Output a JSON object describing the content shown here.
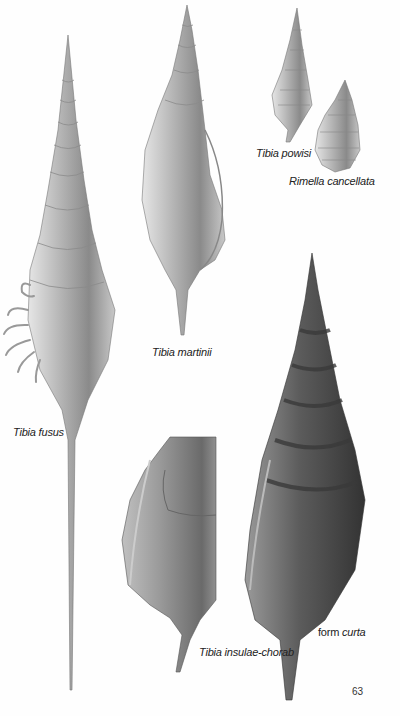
{
  "page": {
    "page_number": "63",
    "background": "#fefefe"
  },
  "specimens": [
    {
      "id": "tibia-fusus",
      "label": "Tibia fusus"
    },
    {
      "id": "tibia-martinii",
      "label": "Tibia martinii"
    },
    {
      "id": "tibia-powisi",
      "label": "Tibia powisi"
    },
    {
      "id": "rimella-cancellata",
      "label": "Rimella cancellata"
    },
    {
      "id": "tibia-insulae-chorab",
      "label": "Tibia insulae-chorab"
    },
    {
      "id": "tibia-curta",
      "label_prefix": "form",
      "label": "curta"
    }
  ]
}
